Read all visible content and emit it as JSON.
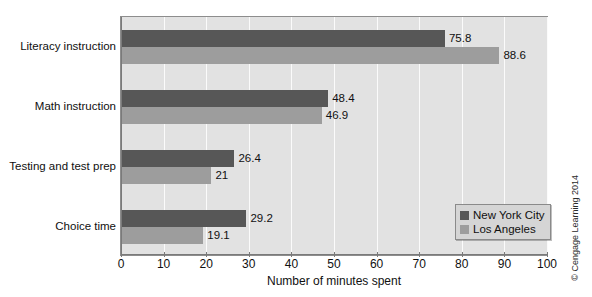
{
  "chart_data": {
    "type": "bar",
    "orientation": "horizontal",
    "title": "",
    "xlabel": "Number of minutes spent",
    "ylabel": "",
    "xlim": [
      0,
      100
    ],
    "xticks": [
      0,
      10,
      20,
      30,
      40,
      50,
      60,
      70,
      80,
      90,
      100
    ],
    "grid": true,
    "legend_position": "lower-right",
    "categories": [
      "Literacy instruction",
      "Math instruction",
      "Testing and test prep",
      "Choice time"
    ],
    "series": [
      {
        "name": "New York City",
        "color": "#575757",
        "values": [
          75.8,
          48.4,
          26.4,
          29.2
        ],
        "labels": [
          "75.8",
          "48.4",
          "26.4",
          "29.2"
        ]
      },
      {
        "name": "Los Angeles",
        "color": "#9d9d9d",
        "values": [
          88.6,
          46.9,
          21,
          19.1
        ],
        "labels": [
          "88.6",
          "46.9",
          "21",
          "19.1"
        ]
      }
    ]
  },
  "legend": {
    "entries": [
      {
        "label": "New York City",
        "color": "#575757"
      },
      {
        "label": "Los Angeles",
        "color": "#9d9d9d"
      }
    ]
  },
  "credit": "© Cengage Learning 2014",
  "colors": {
    "plot_background": "#e2e2e2",
    "gridline": "#fbfbfb",
    "axis": "#7a7a7a",
    "series_1": "#575757",
    "series_2": "#9d9d9d",
    "legend_background": "#d5d5d5"
  }
}
